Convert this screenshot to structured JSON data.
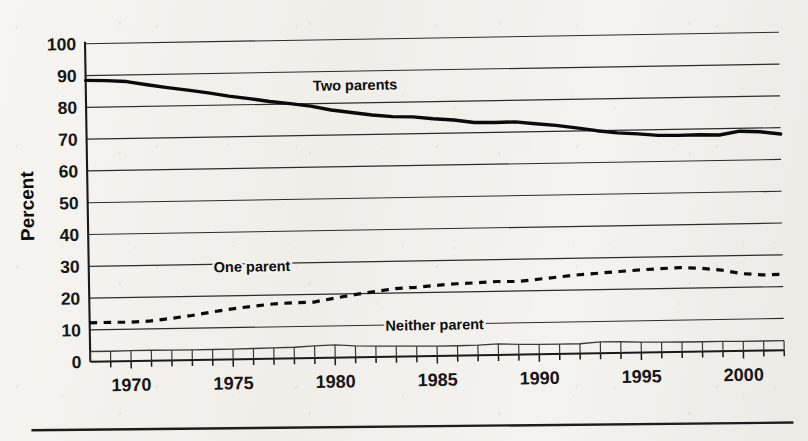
{
  "chart_data": {
    "type": "line",
    "title": "",
    "xlabel": "",
    "ylabel": "Percent",
    "ylim": [
      0,
      100
    ],
    "xlim": [
      1968,
      2002
    ],
    "grid": true,
    "legend_position": "inline-annotations",
    "y_ticks": [
      0,
      10,
      20,
      30,
      40,
      50,
      60,
      70,
      80,
      90,
      100
    ],
    "x_ticks": [
      1970,
      1975,
      1980,
      1985,
      1990,
      1995,
      2000
    ],
    "x_minor_tick_interval": 1,
    "x": [
      1968,
      1969,
      1970,
      1971,
      1972,
      1973,
      1974,
      1975,
      1976,
      1977,
      1978,
      1979,
      1980,
      1981,
      1982,
      1983,
      1984,
      1985,
      1986,
      1987,
      1988,
      1989,
      1990,
      1991,
      1992,
      1993,
      1994,
      1995,
      1996,
      1997,
      1998,
      1999,
      2000,
      2001,
      2002
    ],
    "series": [
      {
        "name": "Two parents",
        "style": "solid-bold",
        "values": [
          88.5,
          88.3,
          87.9,
          86.8,
          85.8,
          84.9,
          83.9,
          82.8,
          81.9,
          80.9,
          80.1,
          79.2,
          77.9,
          77.0,
          76.1,
          75.5,
          75.3,
          74.6,
          74.1,
          73.2,
          73.1,
          73.2,
          72.5,
          71.9,
          71.0,
          70.0,
          69.2,
          68.8,
          68.2,
          68.1,
          68.2,
          68.0,
          69.1,
          68.8,
          68.0
        ]
      },
      {
        "name": "One parent",
        "style": "dashed",
        "values": [
          12.2,
          12.3,
          12.2,
          12.5,
          13.2,
          14.0,
          15.0,
          15.9,
          16.6,
          17.2,
          17.5,
          17.6,
          18.7,
          19.7,
          20.6,
          21.4,
          21.7,
          22.2,
          22.6,
          22.8,
          23.1,
          23.0,
          23.6,
          24.2,
          24.8,
          25.2,
          25.6,
          26.0,
          26.3,
          26.5,
          26.2,
          25.5,
          24.3,
          23.8,
          23.9
        ]
      },
      {
        "name": "Neither parent",
        "style": "thin-with-drop-ticks",
        "values": [
          3.2,
          3.2,
          3.3,
          3.3,
          3.2,
          3.2,
          3.2,
          3.2,
          3.3,
          3.4,
          3.5,
          3.8,
          4.0,
          3.6,
          3.4,
          3.3,
          3.2,
          3.1,
          3.1,
          3.2,
          3.5,
          3.2,
          3.1,
          3.1,
          3.1,
          3.6,
          3.5,
          3.3,
          3.2,
          3.1,
          3.1,
          3.1,
          3.0,
          3.0,
          3.0
        ]
      }
    ],
    "annotations": [
      {
        "text": "Two parents",
        "series": "Two parents",
        "x": 1981.2,
        "y": 84.0
      },
      {
        "text": "One parent",
        "series": "One parent",
        "x": 1976.0,
        "y": 27.5
      },
      {
        "text": "Neither parent",
        "series": "Neither parent",
        "x": 1984.9,
        "y": 8.2
      }
    ]
  },
  "axes": {
    "y_title": "Percent",
    "y_tick_labels": [
      "100",
      "90",
      "80",
      "70",
      "60",
      "50",
      "40",
      "30",
      "20",
      "10",
      "0"
    ],
    "x_tick_labels": [
      "1970",
      "1975",
      "1980",
      "1985",
      "1990",
      "1995",
      "2000"
    ]
  },
  "annotation_labels": {
    "two": "Two parents",
    "one": "One parent",
    "neither": "Neither parent"
  },
  "colors": {
    "ink": "#0a0a0a",
    "grid": "#2c2c2c",
    "paper": "#f3f2ee",
    "neither_line": "#3a3a3a"
  }
}
